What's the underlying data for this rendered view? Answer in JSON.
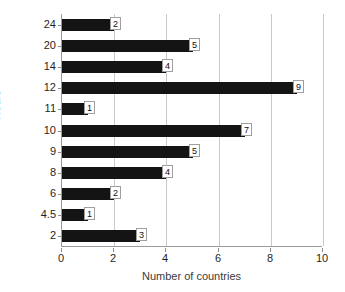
{
  "chart_data": {
    "type": "bar",
    "orientation": "horizontal",
    "title": "",
    "xlabel": "Number of countries",
    "ylabel": "Hours",
    "categories": [
      "24",
      "20",
      "14",
      "12",
      "11",
      "10",
      "9",
      "8",
      "6",
      "4.5",
      "2"
    ],
    "values": [
      2,
      5,
      4,
      9,
      1,
      7,
      5,
      4,
      2,
      1,
      3
    ],
    "data_labels": [
      "2",
      "5",
      "4",
      "9",
      "1",
      "7",
      "5",
      "4",
      "2",
      "1",
      "3"
    ],
    "xlim": [
      0,
      10
    ],
    "xticks": [
      0,
      2,
      4,
      6,
      8,
      10
    ],
    "xtick_labels": [
      "0",
      "2",
      "4",
      "6",
      "8",
      "10"
    ],
    "grid": "vertical",
    "legend": "none",
    "bar_color": "#141414",
    "grid_color": "#c9c9c9",
    "axis_color": "#9a9a9a"
  }
}
